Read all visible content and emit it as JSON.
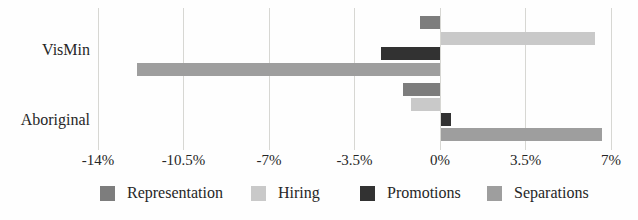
{
  "chart_data": {
    "type": "bar",
    "orientation": "horizontal",
    "title": "",
    "xlabel": "",
    "ylabel": "",
    "categories": [
      "VisMin",
      "Aboriginal"
    ],
    "series": [
      {
        "name": "Representation",
        "color": "#7d7d7d",
        "values": [
          -0.8,
          -1.5
        ]
      },
      {
        "name": "Hiring",
        "color": "#c9c9c9",
        "values": [
          6.3,
          -1.2
        ]
      },
      {
        "name": "Promotions",
        "color": "#323232",
        "values": [
          -2.4,
          0.4
        ]
      },
      {
        "name": "Separations",
        "color": "#9e9e9e",
        "values": [
          -12.4,
          6.6
        ]
      }
    ],
    "xlim": [
      -14,
      7
    ],
    "x_tick_values": [
      -14,
      -10.5,
      -7,
      -3.5,
      0,
      3.5,
      7
    ],
    "x_ticks": [
      "-14%",
      "-10.5%",
      "-7%",
      "-3.5%",
      "0%",
      "3.5%",
      "7%"
    ],
    "grid": "vertical",
    "gridline_color": "#d7d7d3",
    "legend_position": "bottom"
  }
}
